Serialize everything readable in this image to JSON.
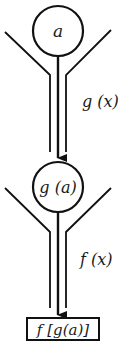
{
  "diagram": {
    "stroke_color": "#111111",
    "background_color": "#ffffff",
    "nodes": [
      {
        "id": "input",
        "shape": "circle",
        "label": "a"
      },
      {
        "id": "intermediate",
        "shape": "circle",
        "label": "g (a)"
      },
      {
        "id": "output",
        "shape": "rectangle",
        "label": "f [g(a)]"
      }
    ],
    "machines": [
      {
        "id": "machine-g",
        "label": "g (x)",
        "from": "input",
        "to": "intermediate"
      },
      {
        "id": "machine-f",
        "label": "f (x)",
        "from": "intermediate",
        "to": "output"
      }
    ]
  }
}
